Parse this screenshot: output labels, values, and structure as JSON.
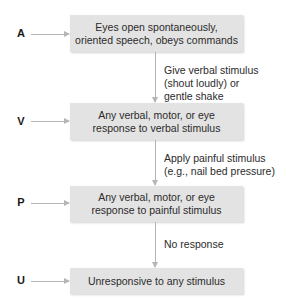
{
  "diagram": {
    "type": "flowchart",
    "levels": [
      {
        "letter": "A",
        "text_line1": "Eyes open spontaneously,",
        "text_line2": "oriented speech, obeys commands"
      },
      {
        "letter": "V",
        "text_line1": "Any verbal, motor, or eye",
        "text_line2": "response to verbal stimulus"
      },
      {
        "letter": "P",
        "text_line1": "Any verbal, motor, or eye",
        "text_line2": "response to painful stimulus"
      },
      {
        "letter": "U",
        "text_line1": "Unresponsive to any stimulus",
        "text_line2": ""
      }
    ],
    "transitions": [
      {
        "from": "A",
        "to": "V",
        "lines": [
          "Give verbal stimulus",
          "(shout loudly) or",
          "gentle shake"
        ]
      },
      {
        "from": "V",
        "to": "P",
        "lines": [
          "Apply painful stimulus",
          "(e.g., nail bed pressure)"
        ]
      },
      {
        "from": "P",
        "to": "U",
        "lines": [
          "No response"
        ]
      }
    ]
  },
  "colors": {
    "box_fill": "#e3e3e3",
    "arrow": "#b5b5b5",
    "text": "#2b2b2b"
  }
}
